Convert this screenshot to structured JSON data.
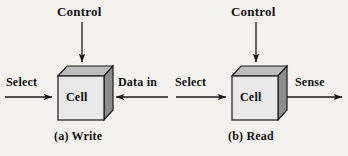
{
  "figure": {
    "background_color": "#f4f2ee",
    "cell_label": "Cell",
    "cube_front_color": "#e9e9e9",
    "cube_top_color": "#bdbdbd",
    "cube_side_color": "#8d8d8d",
    "stroke_color": "#1a1a1a"
  },
  "panels": [
    {
      "id": "write",
      "caption": "(a) Write",
      "cell_label": "Cell",
      "top_signal": {
        "label": "Control",
        "direction": "into-cell-from-top"
      },
      "left_signal": {
        "label": "Select",
        "direction": "into-cell-from-left"
      },
      "right_signal": {
        "label": "Data in",
        "direction": "into-cell-from-right"
      }
    },
    {
      "id": "read",
      "caption": "(b) Read",
      "cell_label": "Cell",
      "top_signal": {
        "label": "Control",
        "direction": "into-cell-from-top"
      },
      "left_signal": {
        "label": "Select",
        "direction": "into-cell-from-left"
      },
      "right_signal": {
        "label": "Sense",
        "direction": "out-of-cell-to-right"
      }
    }
  ]
}
